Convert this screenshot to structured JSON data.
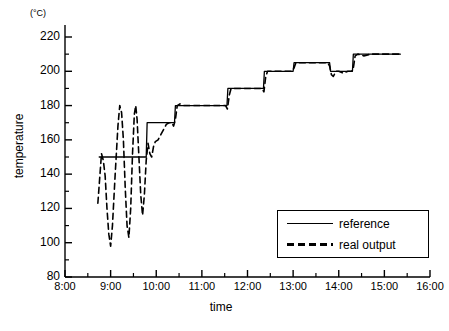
{
  "chart_data": {
    "type": "line",
    "title": "",
    "xlabel": "time",
    "ylabel": "temperature",
    "unit_label": "(°C)",
    "xlim": [
      8,
      16
    ],
    "ylim": [
      80,
      220
    ],
    "ytick_values": [
      80,
      100,
      120,
      140,
      160,
      180,
      200,
      220
    ],
    "ytick_labels": [
      "80",
      "100",
      "120",
      "140",
      "160",
      "180",
      "200",
      "220"
    ],
    "y_minor_step": 10,
    "xtick_values": [
      8,
      9,
      10,
      11,
      12,
      13,
      14,
      15,
      16
    ],
    "xtick_labels": [
      "8:00",
      "9:00",
      "10:00",
      "11:00",
      "12:00",
      "13:00",
      "14:00",
      "15:00",
      "16:00"
    ],
    "x_minor_step": 0.5,
    "grid": false,
    "legend_position": "lower right",
    "series": [
      {
        "name": "reference",
        "style": "solid",
        "color": "#000000",
        "points": [
          [
            8.75,
            150
          ],
          [
            9.78,
            150
          ],
          [
            9.8,
            170
          ],
          [
            10.4,
            170
          ],
          [
            10.42,
            180
          ],
          [
            11.55,
            180
          ],
          [
            11.57,
            190
          ],
          [
            12.35,
            190
          ],
          [
            12.37,
            200
          ],
          [
            13.0,
            200
          ],
          [
            13.02,
            205
          ],
          [
            13.8,
            205
          ],
          [
            13.82,
            200
          ],
          [
            14.3,
            200
          ],
          [
            14.32,
            210
          ],
          [
            15.35,
            210
          ]
        ]
      },
      {
        "name": "real output",
        "style": "dashed",
        "color": "#000000",
        "points": [
          [
            8.72,
            123
          ],
          [
            8.8,
            152
          ],
          [
            8.84,
            148
          ],
          [
            8.88,
            139
          ],
          [
            8.92,
            120
          ],
          [
            8.96,
            105
          ],
          [
            9.0,
            98
          ],
          [
            9.04,
            110
          ],
          [
            9.1,
            140
          ],
          [
            9.16,
            168
          ],
          [
            9.2,
            180
          ],
          [
            9.24,
            176
          ],
          [
            9.28,
            160
          ],
          [
            9.32,
            132
          ],
          [
            9.36,
            110
          ],
          [
            9.4,
            103
          ],
          [
            9.44,
            120
          ],
          [
            9.48,
            152
          ],
          [
            9.52,
            175
          ],
          [
            9.55,
            180
          ],
          [
            9.58,
            172
          ],
          [
            9.62,
            150
          ],
          [
            9.66,
            128
          ],
          [
            9.7,
            116
          ],
          [
            9.74,
            128
          ],
          [
            9.78,
            148
          ],
          [
            9.82,
            158
          ],
          [
            9.86,
            152
          ],
          [
            9.9,
            150
          ],
          [
            9.94,
            156
          ],
          [
            9.98,
            159
          ],
          [
            10.04,
            160
          ],
          [
            10.1,
            163
          ],
          [
            10.16,
            166
          ],
          [
            10.22,
            169
          ],
          [
            10.28,
            170
          ],
          [
            10.34,
            170
          ],
          [
            10.38,
            168
          ],
          [
            10.42,
            172
          ],
          [
            10.46,
            180
          ],
          [
            10.52,
            181
          ],
          [
            10.6,
            180
          ],
          [
            10.8,
            180
          ],
          [
            11.0,
            180
          ],
          [
            11.2,
            180
          ],
          [
            11.4,
            180
          ],
          [
            11.52,
            180
          ],
          [
            11.56,
            178
          ],
          [
            11.6,
            186
          ],
          [
            11.64,
            190
          ],
          [
            11.7,
            190
          ],
          [
            11.9,
            190
          ],
          [
            12.1,
            190
          ],
          [
            12.25,
            190
          ],
          [
            12.32,
            190
          ],
          [
            12.36,
            188
          ],
          [
            12.4,
            197
          ],
          [
            12.44,
            200
          ],
          [
            12.5,
            200
          ],
          [
            12.7,
            200
          ],
          [
            12.9,
            200
          ],
          [
            12.98,
            200
          ],
          [
            13.02,
            202
          ],
          [
            13.06,
            205
          ],
          [
            13.2,
            205
          ],
          [
            13.4,
            205
          ],
          [
            13.6,
            205
          ],
          [
            13.76,
            205
          ],
          [
            13.8,
            203
          ],
          [
            13.84,
            198
          ],
          [
            13.88,
            197
          ],
          [
            13.94,
            200
          ],
          [
            14.0,
            200
          ],
          [
            14.1,
            199
          ],
          [
            14.2,
            200
          ],
          [
            14.28,
            200
          ],
          [
            14.32,
            202
          ],
          [
            14.36,
            209
          ],
          [
            14.42,
            210
          ],
          [
            14.55,
            209
          ],
          [
            14.7,
            210
          ],
          [
            14.85,
            210
          ],
          [
            15.0,
            210
          ],
          [
            15.2,
            210
          ],
          [
            15.35,
            210
          ]
        ]
      }
    ],
    "annotations": []
  },
  "legend": {
    "entries": [
      {
        "label": "reference",
        "style": "solid"
      },
      {
        "label": "real output",
        "style": "dashed"
      }
    ]
  }
}
